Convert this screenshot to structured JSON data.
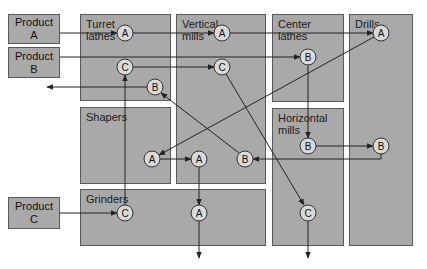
{
  "diagram": {
    "type": "process-layout",
    "colors": {
      "department_fill": "#a9a9a9",
      "border": "#5a5a5a",
      "node_fill": "#d9d9d9",
      "line": "#222222"
    },
    "products": [
      {
        "id": "product-a",
        "label": "Product\nA",
        "x": 8,
        "y": 14,
        "w": 52,
        "h": 30
      },
      {
        "id": "product-b",
        "label": "Product\nB",
        "x": 8,
        "y": 47,
        "w": 52,
        "h": 31
      },
      {
        "id": "product-c",
        "label": "Product\nC",
        "x": 8,
        "y": 197,
        "w": 52,
        "h": 32
      }
    ],
    "departments": [
      {
        "id": "turret-lathes",
        "label": "Turret\nlathes",
        "x": 80,
        "y": 14,
        "w": 91,
        "h": 87
      },
      {
        "id": "shapers",
        "label": "Shapers",
        "x": 80,
        "y": 107,
        "w": 91,
        "h": 77
      },
      {
        "id": "vertical-mills",
        "label": "Vertical\nmills",
        "x": 176,
        "y": 14,
        "w": 90,
        "h": 170
      },
      {
        "id": "grinders",
        "label": "Grinders",
        "x": 80,
        "y": 189,
        "w": 186,
        "h": 57
      },
      {
        "id": "center-lathes",
        "label": "Center lathes",
        "x": 272,
        "y": 14,
        "w": 72,
        "h": 88
      },
      {
        "id": "horizontal-mills",
        "label": "Horizontal\nmills",
        "x": 272,
        "y": 108,
        "w": 72,
        "h": 138
      },
      {
        "id": "drills",
        "label": "Drills",
        "x": 349,
        "y": 14,
        "w": 64,
        "h": 232
      }
    ],
    "nodes": [
      {
        "id": "a-turret",
        "label": "A",
        "x": 125,
        "y": 33
      },
      {
        "id": "a-vmill",
        "label": "A",
        "x": 222,
        "y": 33
      },
      {
        "id": "a-drill",
        "label": "A",
        "x": 381,
        "y": 33
      },
      {
        "id": "c-turret",
        "label": "C",
        "x": 125,
        "y": 67
      },
      {
        "id": "c-vmill",
        "label": "C",
        "x": 222,
        "y": 67
      },
      {
        "id": "b-clathe",
        "label": "B",
        "x": 308,
        "y": 57
      },
      {
        "id": "b-turret",
        "label": "B",
        "x": 155,
        "y": 87
      },
      {
        "id": "a-shaper",
        "label": "A",
        "x": 152,
        "y": 159
      },
      {
        "id": "a-vmill-2",
        "label": "A",
        "x": 199,
        "y": 159
      },
      {
        "id": "b-vmill",
        "label": "B",
        "x": 245,
        "y": 159
      },
      {
        "id": "b-hmill",
        "label": "B",
        "x": 308,
        "y": 146
      },
      {
        "id": "b-drill",
        "label": "B",
        "x": 381,
        "y": 146
      },
      {
        "id": "c-grinder",
        "label": "C",
        "x": 125,
        "y": 213
      },
      {
        "id": "a-grinder",
        "label": "A",
        "x": 199,
        "y": 213
      },
      {
        "id": "c-hmill",
        "label": "C",
        "x": 308,
        "y": 213
      }
    ],
    "flows": [
      {
        "product": "A",
        "points": [
          [
            60,
            33
          ],
          [
            117,
            33
          ]
        ]
      },
      {
        "product": "A",
        "points": [
          [
            133,
            33
          ],
          [
            214,
            33
          ]
        ]
      },
      {
        "product": "A",
        "points": [
          [
            230,
            33
          ],
          [
            373,
            33
          ]
        ]
      },
      {
        "product": "A",
        "points": [
          [
            374,
            37
          ],
          [
            159,
            155
          ]
        ]
      },
      {
        "product": "A",
        "points": [
          [
            160,
            159
          ],
          [
            191,
            159
          ]
        ]
      },
      {
        "product": "A",
        "points": [
          [
            199,
            167
          ],
          [
            199,
            205
          ]
        ]
      },
      {
        "product": "A",
        "points": [
          [
            199,
            221
          ],
          [
            199,
            258
          ]
        ]
      },
      {
        "product": "B",
        "points": [
          [
            60,
            57
          ],
          [
            300,
            57
          ]
        ]
      },
      {
        "product": "B",
        "points": [
          [
            308,
            65
          ],
          [
            308,
            138
          ]
        ]
      },
      {
        "product": "B",
        "points": [
          [
            316,
            146
          ],
          [
            373,
            146
          ]
        ]
      },
      {
        "product": "B",
        "points": [
          [
            381,
            154
          ],
          [
            381,
            159
          ],
          [
            253,
            159
          ]
        ]
      },
      {
        "product": "B",
        "points": [
          [
            239,
            153
          ],
          [
            161,
            93
          ]
        ]
      },
      {
        "product": "B",
        "points": [
          [
            147,
            87
          ],
          [
            47,
            87
          ]
        ]
      },
      {
        "product": "C",
        "points": [
          [
            60,
            213
          ],
          [
            117,
            213
          ]
        ]
      },
      {
        "product": "C",
        "points": [
          [
            125,
            205
          ],
          [
            125,
            75
          ]
        ]
      },
      {
        "product": "C",
        "points": [
          [
            133,
            67
          ],
          [
            214,
            67
          ]
        ]
      },
      {
        "product": "C",
        "points": [
          [
            226,
            74
          ],
          [
            304,
            205
          ]
        ]
      },
      {
        "product": "C",
        "points": [
          [
            308,
            221
          ],
          [
            308,
            258
          ]
        ]
      }
    ]
  }
}
